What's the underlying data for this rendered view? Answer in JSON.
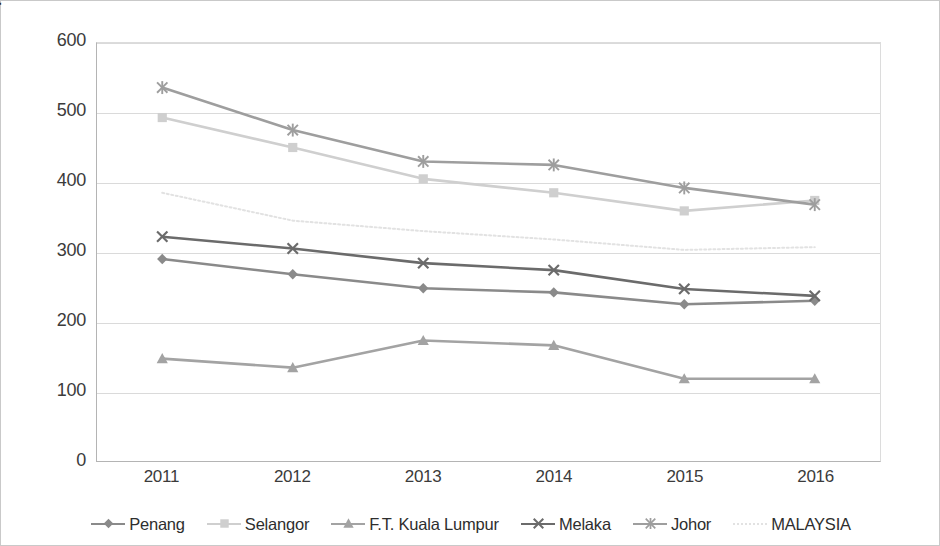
{
  "chart_data": {
    "type": "line",
    "title": "",
    "xlabel": "",
    "ylabel": "Ratio of Nurses to Population (1:x)",
    "categories": [
      "2011",
      "2012",
      "2013",
      "2014",
      "2015",
      "2016"
    ],
    "x": [
      2011,
      2012,
      2013,
      2014,
      2015,
      2016
    ],
    "ylim": [
      0,
      600
    ],
    "yticks": [
      0,
      100,
      200,
      300,
      400,
      500,
      600
    ],
    "grid": true,
    "legend_position": "bottom",
    "series": [
      {
        "name": "Penang",
        "marker": "diamond",
        "color": "#8a8a8a",
        "values": [
          290,
          268,
          248,
          242,
          225,
          230
        ]
      },
      {
        "name": "Selangor",
        "marker": "square",
        "color": "#cfcfcf",
        "values": [
          493,
          450,
          405,
          385,
          359,
          374
        ]
      },
      {
        "name": "F.T. Kuala Lumpur",
        "marker": "triangle",
        "color": "#a3a3a3",
        "values": [
          147,
          134,
          173,
          166,
          118,
          118
        ]
      },
      {
        "name": "Melaka",
        "marker": "x",
        "color": "#6b6b6b",
        "values": [
          322,
          305,
          284,
          274,
          247,
          237
        ]
      },
      {
        "name": "Johor",
        "marker": "asterisk",
        "color": "#9e9e9e",
        "values": [
          536,
          475,
          430,
          425,
          392,
          368
        ]
      },
      {
        "name": "MALAYSIA",
        "marker": "none",
        "color": "#e2e2e2",
        "dashed": true,
        "values": [
          385,
          345,
          330,
          318,
          303,
          307
        ]
      }
    ]
  },
  "axis": {
    "y_title": "Ratio of Nurses to Population (1:x)",
    "y_ticks": [
      "0",
      "100",
      "200",
      "300",
      "400",
      "500",
      "600"
    ],
    "x_ticks": [
      "2011",
      "2012",
      "2013",
      "2014",
      "2015",
      "2016"
    ]
  },
  "legend": {
    "items": [
      {
        "label": "Penang"
      },
      {
        "label": "Selangor"
      },
      {
        "label": "F.T. Kuala Lumpur"
      },
      {
        "label": "Melaka"
      },
      {
        "label": "Johor"
      },
      {
        "label": "MALAYSIA"
      }
    ]
  },
  "colors": {
    "border": "#c9c9c9",
    "gridline": "#dadada",
    "axis": "#b4b4b4",
    "text": "#3b3b3b"
  }
}
